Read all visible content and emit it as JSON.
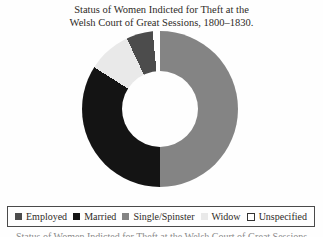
{
  "title": {
    "line1": "Status of Women Indicted for Theft at the",
    "line2": "Welsh Court of Great Sessions, 1800–1830."
  },
  "chart_data": {
    "type": "pie",
    "subtype": "donut",
    "title": "Status of Women Indicted for Theft at the Welsh Court of Great Sessions, 1800–1830.",
    "direction": "clockwise",
    "start_angle_deg_from_top": 0,
    "inner_radius_ratio": 0.49,
    "values_unit": "percent (estimated from arc angles)",
    "segments": [
      {
        "label": "Single/Spinster",
        "value": 50,
        "color": "#848484"
      },
      {
        "label": "Married",
        "value": 34,
        "color": "#141414"
      },
      {
        "label": "Widow",
        "value": 9,
        "color": "#e9e9e9"
      },
      {
        "label": "Employed",
        "value": 5.5,
        "color": "#4c4c4c"
      },
      {
        "label": "Unspecified",
        "value": 1.5,
        "color": "#ffffff"
      }
    ],
    "legend_position": "bottom"
  },
  "legend": {
    "items": [
      {
        "label": "Employed",
        "color": "#4c4c4c",
        "bordered": false
      },
      {
        "label": "Married",
        "color": "#141414",
        "bordered": false
      },
      {
        "label": "Single/Spinster",
        "color": "#848484",
        "bordered": false
      },
      {
        "label": "Widow",
        "color": "#e9e9e9",
        "bordered": false
      },
      {
        "label": "Unspecified",
        "color": "#ffffff",
        "bordered": true
      }
    ]
  },
  "partial_caption": "Status of Women Indicted for Theft at the Welsh Court of Great Sessions"
}
